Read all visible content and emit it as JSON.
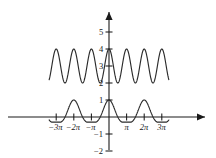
{
  "figure": {
    "name": "trig-graph",
    "background": "#ffffff",
    "ink_color": "#2b2b2b",
    "width": 216,
    "height": 158
  },
  "axes": {
    "x_axis_label": "",
    "y_axis_label": "",
    "origin_px": {
      "x": 109,
      "y": 117
    },
    "x_unit_px": 17.6,
    "y_unit_px": 17.0,
    "xlim": [
      -3.4,
      3.4
    ],
    "ylim": [
      -2.4,
      5.6
    ],
    "x_arrow": "right-arrow",
    "y_arrow": "up-arrow",
    "x_ticks": [
      {
        "value": -3,
        "label": "−3π"
      },
      {
        "value": -2,
        "label": "−2π"
      },
      {
        "value": -1,
        "label": "−π"
      },
      {
        "value": 1,
        "label": "π"
      },
      {
        "value": 2,
        "label": "2π"
      },
      {
        "value": 3,
        "label": "3π"
      }
    ],
    "y_ticks": [
      {
        "value": 5,
        "label": "5"
      },
      {
        "value": 4,
        "label": "4"
      },
      {
        "value": 3,
        "label": "3"
      },
      {
        "value": 2,
        "label": "2"
      },
      {
        "value": 1,
        "label": "1"
      },
      {
        "value": -1,
        "label": "−1"
      },
      {
        "value": -2,
        "label": "−2"
      }
    ]
  },
  "chart_data": {
    "type": "line",
    "title": "",
    "subtitle": "",
    "xlabel": "",
    "ylabel": "",
    "xlim": [
      -3.4,
      3.4
    ],
    "ylim": [
      -2.4,
      5.6
    ],
    "grid": false,
    "legend": "none",
    "x_unit": "pi",
    "annotations": [],
    "series": [
      {
        "name": "upper-cosine",
        "description": "cosine offset 3, amplitude 1, period pi",
        "formula": "y = 3 + cos(2x)",
        "offset": 3,
        "amplitude": 1,
        "period_in_pi": 1,
        "ymin": 2,
        "ymax": 4,
        "x_of_maxima": [
          -3,
          -2,
          -1,
          0,
          1,
          2,
          3
        ],
        "x_of_minima": [
          -2.5,
          -1.5,
          -0.5,
          0.5,
          1.5,
          2.5
        ]
      },
      {
        "name": "lower-beat",
        "description": "product of cosines, main lobes at 0 and +/-2pi, small negative lobes between",
        "formula": "y = cos(x)·cos(x/2)² style beat",
        "ymin": -0.32,
        "ymax": 1,
        "x_of_maxima": [
          -2,
          0,
          2
        ],
        "peak_value": 1,
        "x_of_minor_lobes": [
          -2.95,
          -2.5,
          -1.45,
          -1.0,
          -0.5,
          0.5,
          1.0,
          1.45,
          2.5,
          2.95
        ],
        "minor_lobe_value": -0.3
      }
    ]
  }
}
